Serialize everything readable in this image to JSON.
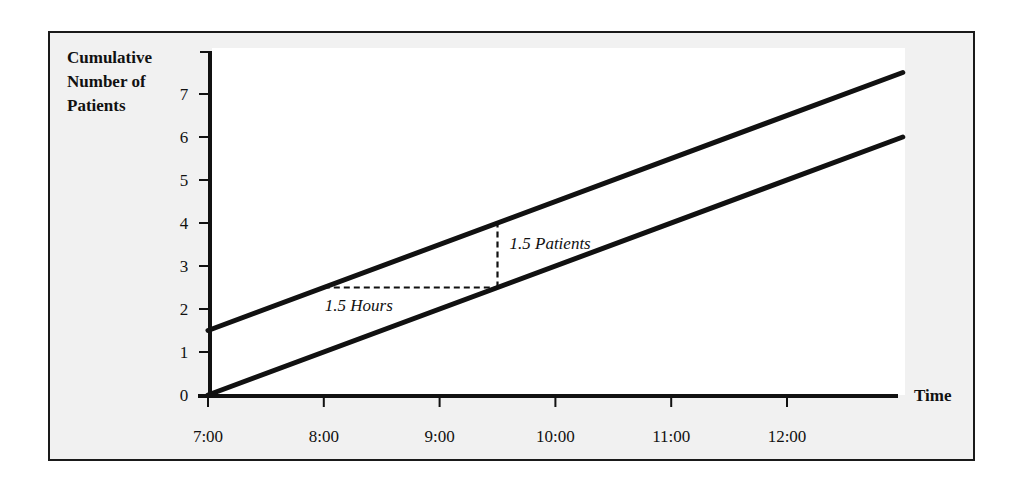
{
  "chart_data": {
    "type": "line",
    "title": "",
    "xlabel": "Time",
    "ylabel": "Cumulative Number of Patients",
    "ylabel_lines": [
      "Cumulative",
      "Number of",
      "Patients"
    ],
    "x_ticks": [
      "7:00",
      "8:00",
      "9:00",
      "10:00",
      "11:00",
      "12:00"
    ],
    "y_ticks": [
      0,
      1,
      2,
      3,
      4,
      5,
      6,
      7
    ],
    "xlim_hours": [
      0,
      6
    ],
    "ylim": [
      0,
      8
    ],
    "grid": false,
    "legend": null,
    "series": [
      {
        "name": "Upper cumulative line",
        "x": [
          "7:00",
          "13:00"
        ],
        "values": [
          1.5,
          7.5
        ]
      },
      {
        "name": "Lower cumulative line",
        "x": [
          "7:00",
          "13:00"
        ],
        "values": [
          0,
          6
        ]
      }
    ],
    "annotations": [
      {
        "type": "dashed-horizontal",
        "label": "1.5 Hours",
        "from": {
          "x": "8:00",
          "y": 2.5
        },
        "to": {
          "x": "9:30",
          "y": 2.5
        }
      },
      {
        "type": "dashed-vertical",
        "label": "1.5 Patients",
        "from": {
          "x": "9:30",
          "y": 2.5
        },
        "to": {
          "x": "9:30",
          "y": 4.0
        }
      }
    ]
  }
}
